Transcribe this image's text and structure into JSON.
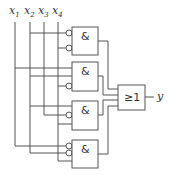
{
  "diagram": {
    "type": "logic-circuit",
    "inputs": [
      {
        "name": "x",
        "sub": "1"
      },
      {
        "name": "x",
        "sub": "2"
      },
      {
        "name": "x",
        "sub": "3"
      },
      {
        "name": "x",
        "sub": "4"
      }
    ],
    "gates": [
      {
        "id": "and1",
        "symbol": "&",
        "inputs": [
          "¬x2",
          "¬x4"
        ]
      },
      {
        "id": "and2",
        "symbol": "&",
        "inputs": [
          "x1",
          "x2",
          "¬x4"
        ]
      },
      {
        "id": "and3",
        "symbol": "&",
        "inputs": [
          "x2",
          "¬x3",
          "x4"
        ]
      },
      {
        "id": "and4",
        "symbol": "&",
        "inputs": [
          "¬x1",
          "¬x2",
          "x4"
        ]
      }
    ],
    "or_gate": {
      "symbol": "≥1",
      "inputs": [
        "and1",
        "and2",
        "and3",
        "and4"
      ]
    },
    "output": {
      "name": "y"
    }
  }
}
